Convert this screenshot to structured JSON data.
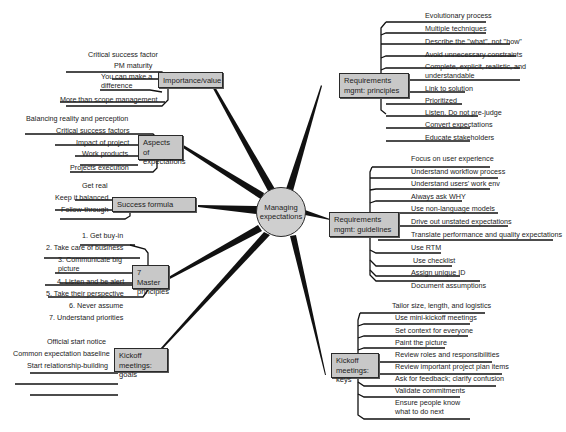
{
  "center": {
    "label": "Managing expectations",
    "fill": "#cfcfcf"
  },
  "colors": {
    "box_fill": "#c8c8c8",
    "line": "#111111",
    "background": "#ffffff"
  },
  "branches": {
    "importance": {
      "label": "Importance/value",
      "items": [
        "Critical success factor",
        "PM maturity",
        "You can make a difference",
        "More than scope management"
      ]
    },
    "aspects": {
      "label": "Aspects of expectations",
      "items": [
        "Balancing reality and perception",
        "Critical success factors",
        "Impact of project",
        "Work products",
        "Projects execution"
      ]
    },
    "success": {
      "label": "Success formula",
      "items": [
        "Get real",
        "Keep it balanced",
        "Follow-through"
      ]
    },
    "master": {
      "label": "7 Master principles",
      "items": [
        "1. Get buy-in",
        "2. Take care of business",
        "3. Communicate big picture",
        "4. Listen and be alert",
        "5. Take their perspective",
        "6. Never assume",
        "7. Understand priorities"
      ]
    },
    "kickoff_goals": {
      "label": "Kickoff meetings: goals",
      "items": [
        "Official start notice",
        "Common expectation baseline",
        "Start relationship-building"
      ]
    },
    "req_principles": {
      "label": "Requirements mgmt: principles",
      "items": [
        "Evolutionary process",
        "Multiple techniques",
        "Describe the \"what\", not \"how\"",
        "Avoid unnecessary constraints",
        "Complete, explicit, realistic, and understandable",
        "Link to solution",
        "Prioritized",
        "Listen. Do not pre-judge",
        "Convert expectations",
        "Educate stakeholders"
      ]
    },
    "req_guidelines": {
      "label": "Requirements mgmt: guidelines",
      "items": [
        "Focus on user experience",
        "Understand workflow process",
        "Understand users' work env",
        "Always ask WHY",
        "Use non-language models",
        "Drive out unstated expectations",
        "Translate performance and quality expectations",
        "Use RTM",
        "Use checklist",
        "Assign unique ID",
        "Document assumptions"
      ]
    },
    "kickoff_keys": {
      "label": "Kickoff meetings: keys",
      "items": [
        "Tailor size, length, and logistics",
        "Use mini-kickoff meetings",
        "Set context for everyone",
        "Paint the picture",
        "Review roles and responsibilities",
        "Review important project plan items",
        "Ask for feedback; clarify confusion",
        "Validate commitments",
        "Ensure people know what to do next"
      ]
    }
  }
}
